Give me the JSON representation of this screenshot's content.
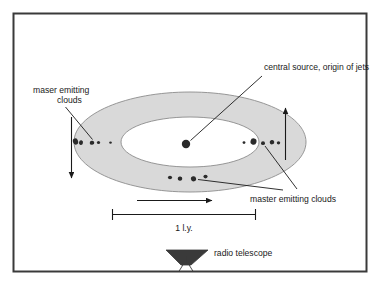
{
  "figure": {
    "title_visible": false,
    "background_color": "#ffffff",
    "border_color": "#3a3a3a",
    "disk_fill_color": "#d9d9d9",
    "disk_stroke_color": "#8c8c8c",
    "cloud_color": "#2b2b2b",
    "central_source_color": "#2b2b2b",
    "telescope_color": "#3a3a3a"
  },
  "labels": {
    "central_source": "central source, origin of jets",
    "maser_clouds_left_line1": "maser emitting",
    "maser_clouds_left_line2": "clouds",
    "maser_clouds_right": "master emitting clouds",
    "scale_bar": "1 l.y.",
    "radio_telescope": "radio telescope"
  },
  "icons": {
    "radio_telescope": "radio-telescope-dish-icon"
  },
  "diagram_data": {
    "type": "schematic-diagram",
    "subject": "Edge-on accretion disk (torus) with maser emitting clouds around a central source",
    "scale_bar_length_label": "1 l.y.",
    "components": [
      {
        "name": "accretion-disk",
        "shape": "annulus-ellipse",
        "fill": "#d9d9d9"
      },
      {
        "name": "central-source",
        "shape": "filled-circle"
      },
      {
        "name": "maser-cloud-cluster-left",
        "count": 5
      },
      {
        "name": "maser-cloud-cluster-right",
        "count": 5
      },
      {
        "name": "maser-cloud-cluster-bottom",
        "count": 4
      },
      {
        "name": "rotation-arrow-left",
        "direction": "down"
      },
      {
        "name": "rotation-arrow-right",
        "direction": "up"
      },
      {
        "name": "rotation-arrow-bottom",
        "direction": "right"
      },
      {
        "name": "radio-telescope",
        "shape": "dish-on-tripod"
      }
    ],
    "clouds_left": [
      {
        "cx": 75.5,
        "cy": 141.5,
        "rx": 2.6,
        "ry": 3.2,
        "rot": -18
      },
      {
        "cx": 81.0,
        "cy": 142.6,
        "rx": 2.0,
        "ry": 2.4,
        "rot": 12
      },
      {
        "cx": 92.0,
        "cy": 142.8,
        "rx": 2.3,
        "ry": 2.0,
        "rot": -10
      },
      {
        "cx": 98.5,
        "cy": 142.4,
        "rx": 1.6,
        "ry": 1.5,
        "rot": 0
      },
      {
        "cx": 110.5,
        "cy": 142.6,
        "rx": 1.3,
        "ry": 1.2,
        "rot": 0
      }
    ],
    "clouds_right": [
      {
        "cx": 244.0,
        "cy": 142.6,
        "rx": 1.4,
        "ry": 1.3,
        "rot": 0
      },
      {
        "cx": 253.5,
        "cy": 141.6,
        "rx": 3.0,
        "ry": 3.2,
        "rot": 15
      },
      {
        "cx": 263.0,
        "cy": 143.2,
        "rx": 2.0,
        "ry": 1.9,
        "rot": 0
      },
      {
        "cx": 272.0,
        "cy": 142.2,
        "rx": 2.3,
        "ry": 2.2,
        "rot": -12
      },
      {
        "cx": 278.5,
        "cy": 142.8,
        "rx": 1.7,
        "ry": 1.6,
        "rot": 0
      }
    ],
    "clouds_bottom": [
      {
        "cx": 170.0,
        "cy": 177.5,
        "rx": 2.1,
        "ry": 1.8,
        "rot": 0
      },
      {
        "cx": 180.0,
        "cy": 178.6,
        "rx": 2.3,
        "ry": 2.1,
        "rot": 10
      },
      {
        "cx": 193.5,
        "cy": 178.8,
        "rx": 2.6,
        "ry": 2.6,
        "rot": -12
      },
      {
        "cx": 205.5,
        "cy": 176.6,
        "rx": 2.1,
        "ry": 1.8,
        "rot": 0
      }
    ]
  }
}
